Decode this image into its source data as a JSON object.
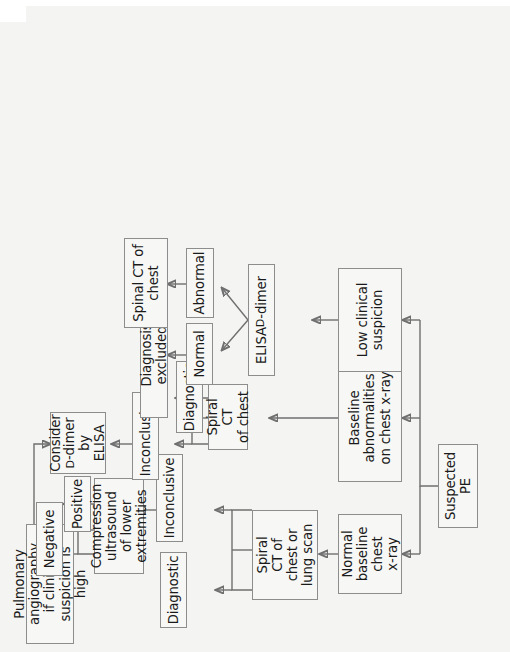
{
  "figure": {
    "type": "flowchart",
    "orientation": "rotated-90",
    "colors": {
      "page_background": "#f4f4f2",
      "node_fill": "#f7f7f5",
      "node_border": "#8d8d8d",
      "connector": "#6f6f6f",
      "text": "#1b1b1b"
    }
  },
  "nodes": {
    "suspected_pe": "Suspected\nPE",
    "normal_baseline": "Normal\nbaseline\nchest\nx-ray",
    "baseline_abnormal": "Baseline\nabnormalities\non chest x-ray",
    "low_clinical": "Low clinical\nsuspicion",
    "spiral_ct_lung_scan": "Spiral\nCT of\nchest or\nlung scan",
    "spiral_ct_chest": "Spiral CT\nof chest",
    "elisa_d_dimer_pre": "ELISA ",
    "elisa_d_dimer_sc": "D",
    "elisa_d_dimer_post": "-dimer",
    "diagnostic_left": "Diagnostic",
    "inconclusive_left": "Inconclusive",
    "diagnostic_right": "Diagnostic",
    "inconclusive_right": "Inconclusive",
    "compression_us": "Compression\nultrasound\nof lower\nextremities",
    "negative": "Negative",
    "positive": "Positive",
    "consider_line1": "Consider",
    "consider_sc": "D",
    "consider_line2": "-dimer",
    "consider_line3": "by ELISA",
    "pulmonary_angiography": "Pulmonary\nangiography\nif clinical\nsuspicion is\nhigh",
    "normal": "Normal",
    "abnormal": "Abnormal",
    "diagnosis_excluded": "Diagnosis excluded",
    "spinal_ct_chest": "Spinal CT of\nchest"
  },
  "edges": [
    {
      "from": "suspected_pe",
      "to": "normal_baseline"
    },
    {
      "from": "suspected_pe",
      "to": "baseline_abnormal"
    },
    {
      "from": "suspected_pe",
      "to": "low_clinical"
    },
    {
      "from": "normal_baseline",
      "to": "spiral_ct_lung_scan"
    },
    {
      "from": "baseline_abnormal",
      "to": "spiral_ct_chest"
    },
    {
      "from": "low_clinical",
      "to": "elisa_d_dimer"
    },
    {
      "from": "spiral_ct_lung_scan",
      "to": "diagnostic_left"
    },
    {
      "from": "spiral_ct_lung_scan",
      "to": "inconclusive_left"
    },
    {
      "from": "spiral_ct_chest",
      "to": "diagnostic_right"
    },
    {
      "from": "spiral_ct_chest",
      "to": "inconclusive_right"
    },
    {
      "from": "inconclusive_left",
      "to": "compression_us"
    },
    {
      "from": "inconclusive_right",
      "to": "consider_d_dimer"
    },
    {
      "from": "compression_us",
      "to": "negative"
    },
    {
      "from": "compression_us",
      "to": "positive"
    },
    {
      "from": "negative",
      "to": "pulmonary_angiography"
    },
    {
      "from": "negative",
      "to": "consider_d_dimer"
    },
    {
      "from": "elisa_d_dimer",
      "to": "normal"
    },
    {
      "from": "elisa_d_dimer",
      "to": "abnormal"
    },
    {
      "from": "normal",
      "to": "diagnosis_excluded"
    },
    {
      "from": "abnormal",
      "to": "spinal_ct_chest"
    }
  ]
}
